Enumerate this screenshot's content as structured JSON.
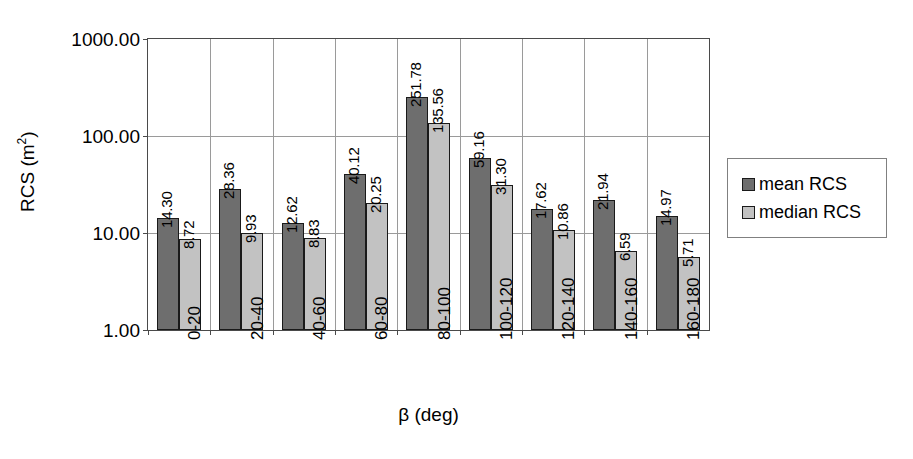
{
  "chart_data": {
    "type": "bar",
    "title": "",
    "xlabel": "β (deg)",
    "ylabel": "RCS (m2)",
    "yscale": "log",
    "ylim": [
      1.0,
      1000.0
    ],
    "grid": "horizontal-and-category-separators",
    "legend_position": "right",
    "categories": [
      "0-20",
      "20-40",
      "40-60",
      "60-80",
      "80-100",
      "100-120",
      "120-140",
      "140-160",
      "160-180"
    ],
    "y_ticks": [
      "1.00",
      "10.00",
      "100.00",
      "1000.00"
    ],
    "y_tick_values": [
      1,
      10,
      100,
      1000
    ],
    "series": [
      {
        "name": "mean RCS",
        "color": "#6e6e6e",
        "values": [
          14.3,
          28.36,
          12.62,
          40.12,
          251.78,
          59.16,
          17.62,
          21.94,
          14.97
        ],
        "labels": [
          "14.30",
          "28.36",
          "12.62",
          "40.12",
          "251.78",
          "59.16",
          "17.62",
          "21.94",
          "14.97"
        ]
      },
      {
        "name": "median RCS",
        "color": "#c2c2c2",
        "values": [
          8.72,
          9.93,
          8.83,
          20.25,
          135.56,
          31.3,
          10.86,
          6.59,
          5.71
        ],
        "labels": [
          "8.72",
          "9.93",
          "8.83",
          "20.25",
          "135.56",
          "31.30",
          "10.86",
          "6.59",
          "5.71"
        ]
      }
    ]
  },
  "axes": {
    "y_title_main": "RCS (m",
    "y_title_sup": "2",
    "y_title_end": ")",
    "x_title": "β (deg)"
  },
  "legend": {
    "items": [
      {
        "label": "mean RCS",
        "color": "#6e6e6e"
      },
      {
        "label": "median RCS",
        "color": "#c2c2c2"
      }
    ]
  }
}
